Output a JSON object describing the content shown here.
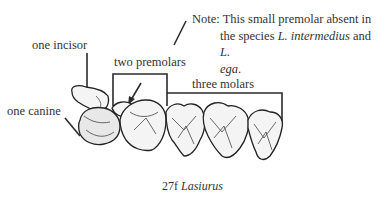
{
  "figure": {
    "caption_number": "27f",
    "caption_genus": "Lasiurus"
  },
  "labels": {
    "incisor": "one incisor",
    "canine": "one canine",
    "premolars": "two premolars",
    "molars": "three molars"
  },
  "note": {
    "line1": "Note: This small premolar absent in",
    "line2_pre": "the species ",
    "line2_species1": "L. intermedius",
    "line2_mid": " and ",
    "line2_species2_part1": "L.",
    "line3_species2_part2": "ega",
    "line3_end": "."
  },
  "colors": {
    "ink": "#333333",
    "background": "#ffffff"
  }
}
